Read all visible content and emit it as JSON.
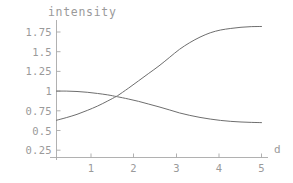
{
  "chart_data": {
    "type": "line",
    "title": "",
    "xlabel": "d",
    "ylabel": "intensity",
    "ylabel_position": "top",
    "xlabel_position": "axis-end-right",
    "xlim": [
      -0.15,
      5.25
    ],
    "ylim": [
      0,
      1.93
    ],
    "grid": false,
    "legend": null,
    "axis_style": "mathematica-default",
    "x_ticks": [
      1,
      2,
      3,
      4,
      5
    ],
    "x_tick_labels": [
      "1",
      "2",
      "3",
      "4",
      "5"
    ],
    "y_ticks": [
      0.25,
      0.5,
      0.75,
      1,
      1.25,
      1.5,
      1.75
    ],
    "y_tick_labels": [
      "0.25",
      "0.5",
      "0.75",
      "1",
      "1.25",
      "1.5",
      "1.75"
    ],
    "series": [
      {
        "name": "rising",
        "color": "#6e6e6e",
        "x": [
          0,
          0.25,
          0.5,
          0.75,
          1,
          1.25,
          1.45,
          1.5,
          1.75,
          2,
          2.25,
          2.5,
          2.75,
          3,
          3.25,
          3.5,
          3.75,
          4,
          4.25,
          4.5,
          4.75,
          5
        ],
        "y": [
          0.63,
          0.665,
          0.705,
          0.755,
          0.81,
          0.875,
          0.93,
          0.945,
          1.035,
          1.13,
          1.225,
          1.32,
          1.425,
          1.53,
          1.615,
          1.685,
          1.74,
          1.775,
          1.795,
          1.81,
          1.818,
          1.82
        ]
      },
      {
        "name": "falling",
        "color": "#6e6e6e",
        "x": [
          0,
          0.25,
          0.5,
          0.75,
          1,
          1.25,
          1.45,
          1.5,
          1.75,
          2,
          2.25,
          2.5,
          2.75,
          3,
          3.25,
          3.5,
          3.75,
          4,
          4.25,
          4.5,
          4.75,
          5
        ],
        "y": [
          1.0,
          1.0,
          0.995,
          0.985,
          0.97,
          0.952,
          0.932,
          0.927,
          0.9,
          0.87,
          0.835,
          0.8,
          0.762,
          0.723,
          0.692,
          0.666,
          0.645,
          0.628,
          0.616,
          0.608,
          0.603,
          0.6
        ]
      }
    ]
  },
  "axis_titles": {
    "y": "intensity",
    "x": "d"
  }
}
